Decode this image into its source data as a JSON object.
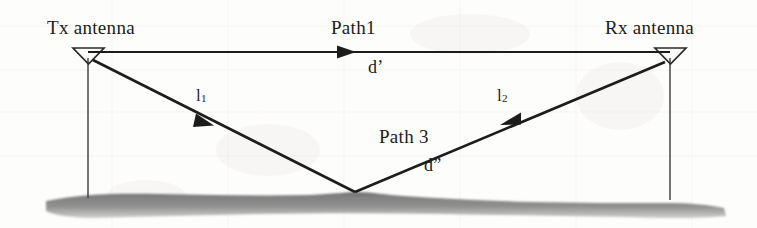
{
  "figure": {
    "type": "two-ray-propagation-diagram",
    "background_color": "#fdfdfc",
    "line_color": "#1c1c1c",
    "ground_color": "#8a8a8a",
    "text_color": "#1c1c1c"
  },
  "labels": {
    "tx_antenna": "Tx antenna",
    "rx_antenna": "Rx antenna",
    "path1": "Path1",
    "d_prime": "d’",
    "l1_symbol": "l",
    "l1_subscript": "1",
    "l2_symbol": "l",
    "l2_subscript": "2",
    "path3": "Path 3",
    "d_double_prime": "d”"
  },
  "icons": {
    "tx_antenna_icon": "antenna-triangle-icon",
    "rx_antenna_icon": "antenna-triangle-icon",
    "direct_path_arrow": "arrow-right-icon",
    "incident_ray_arrow": "arrow-down-right-icon",
    "reflected_ray_arrow": "arrow-up-right-icon",
    "ground_surface": "ground-terrain-icon"
  },
  "geometry": {
    "tx_mast_x": 88,
    "rx_mast_x": 670,
    "antenna_top_y": 48,
    "ground_y": 196,
    "direct_path_y": 52,
    "reflection_point_x": 355,
    "reflection_point_y": 192,
    "direct_path_arrow_x": 350,
    "incident_arrow_x": 205,
    "incident_arrow_y": 120,
    "reflected_arrow_x": 510,
    "reflected_arrow_y": 119
  }
}
